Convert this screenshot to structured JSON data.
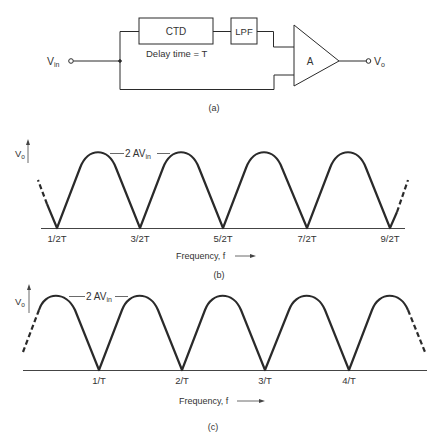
{
  "figure_a": {
    "caption": "(a)",
    "input_label": "V",
    "input_sub": "in",
    "output_label": "V",
    "output_sub": "o",
    "ctd_label": "CTD",
    "delay_label": "Delay time = T",
    "lpf_label": "LPF",
    "amp_label": "A"
  },
  "figure_b": {
    "caption": "(b)",
    "y_label": "V",
    "y_sub": "o",
    "peak_label": "2 AV",
    "peak_sub": "in",
    "x_axis_label": "Frequency, f",
    "ticks": [
      "1/2T",
      "3/2T",
      "5/2T",
      "7/2T",
      "9/2T"
    ]
  },
  "figure_c": {
    "caption": "(c)",
    "y_label": "V",
    "y_sub": "o",
    "peak_label": "2 AV",
    "peak_sub": "in",
    "x_axis_label": "Frequency, f",
    "ticks": [
      "1/T",
      "2/T",
      "3/T",
      "4/T"
    ]
  },
  "colors": {
    "line": "#2a2a2a",
    "text": "#333333",
    "background": "#ffffff"
  }
}
